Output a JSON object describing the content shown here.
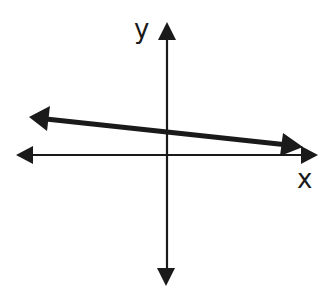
{
  "diagram": {
    "type": "coordinate-plane-line",
    "axes": {
      "x_label": "x",
      "y_label": "y",
      "color": "#1a1a1a",
      "both_ends_arrowed": true
    },
    "line": {
      "slope_sign": "negative",
      "y_intercept_sign": "positive",
      "color": "#1a1a1a",
      "both_ends_arrowed": true
    }
  }
}
